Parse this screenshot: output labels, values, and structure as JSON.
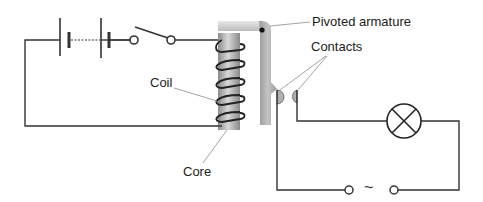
{
  "diagram": {
    "labels": {
      "pivoted_armature": "Pivoted armature",
      "contacts": "Contacts",
      "coil": "Coil",
      "core": "Core"
    },
    "components": {
      "primary_circuit": [
        "battery",
        "switch",
        "coil",
        "core"
      ],
      "secondary_circuit": [
        "contacts",
        "lamp",
        "ac-supply"
      ]
    },
    "symbols": {
      "ac_supply": "~"
    },
    "colors": {
      "wire": "#333333",
      "core_light": "#d0d0d0",
      "core_dark": "#8a8a8a",
      "armature": "#a9a9a9",
      "leader_line": "#999999",
      "text": "#222222"
    }
  }
}
